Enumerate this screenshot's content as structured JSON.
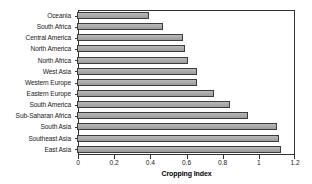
{
  "chart_data": {
    "type": "bar",
    "orientation": "horizontal",
    "title": "",
    "xlabel": "Cropping Index",
    "ylabel": "",
    "xlim": [
      0,
      1.2
    ],
    "xticks": [
      "0",
      "0.2",
      "0.4",
      "0.6",
      "0.8",
      "1",
      "1.2"
    ],
    "xtick_values": [
      0,
      0.2,
      0.4,
      0.6,
      0.8,
      1,
      1.2
    ],
    "grid": false,
    "legend": "none",
    "bar_color": "#ababab",
    "bar_edge_color": "#3b3b3b",
    "categories": [
      "Oceania",
      "South Africa",
      "Central America",
      "North America",
      "North Africa",
      "West Asia",
      "Western Europe",
      "Eastern Europe",
      "South America",
      "Sub-Saharan Africa",
      "South Asia",
      "Southeast Asia",
      "East Asia"
    ],
    "values": [
      0.39,
      0.47,
      0.58,
      0.59,
      0.61,
      0.66,
      0.66,
      0.75,
      0.84,
      0.94,
      1.1,
      1.11,
      1.12
    ]
  }
}
